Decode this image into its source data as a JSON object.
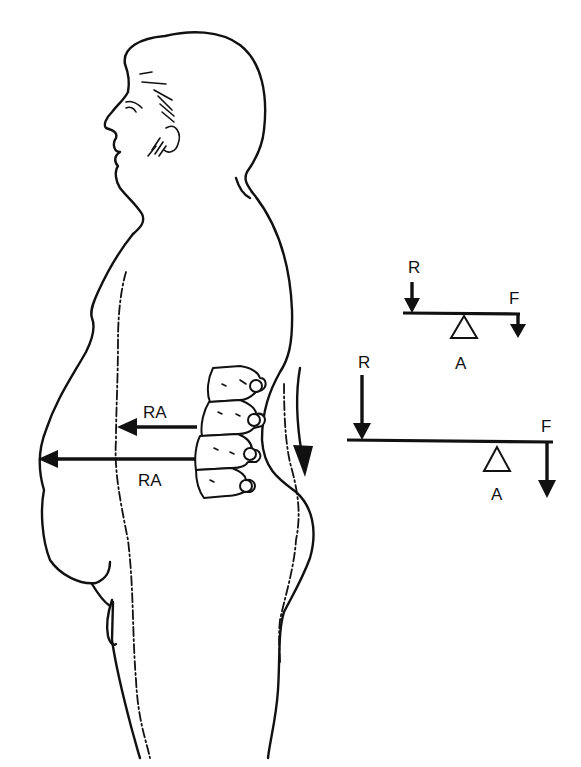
{
  "figure": {
    "colors": {
      "ink": "#111111",
      "background": "#ffffff"
    }
  },
  "body_diagram": {
    "spine_force_arrows": [
      {
        "label": "RA",
        "position": "upper"
      },
      {
        "label": "RA",
        "position": "lower"
      }
    ],
    "lordosis_arrow_icon": "curved-arrow-down"
  },
  "levers": [
    {
      "name": "small-lever",
      "resistance_label": "R",
      "force_label": "F",
      "axis_label": "A"
    },
    {
      "name": "large-lever",
      "resistance_label": "R",
      "force_label": "F",
      "axis_label": "A"
    }
  ]
}
